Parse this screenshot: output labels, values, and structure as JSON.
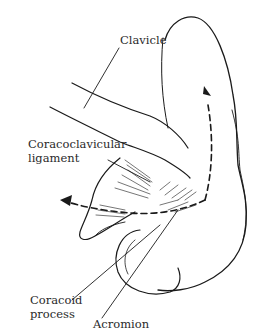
{
  "figure": {
    "type": "anatomical line drawing",
    "ink_color": "#1a1a1a",
    "background_color": "#ffffff"
  },
  "labels": {
    "clavicle": "Clavicle",
    "coracoclavicular_line1": "Coracoclavicular",
    "coracoclavicular_line2": "ligament",
    "coracoid_line1": "Coracoid",
    "coracoid_line2": "process",
    "acromion": "Acromion"
  },
  "arrows": [
    {
      "name": "upward-rotation-arrow",
      "style": "dashed",
      "direction": "up"
    },
    {
      "name": "leftward-arrow",
      "style": "dashed",
      "direction": "left"
    }
  ]
}
